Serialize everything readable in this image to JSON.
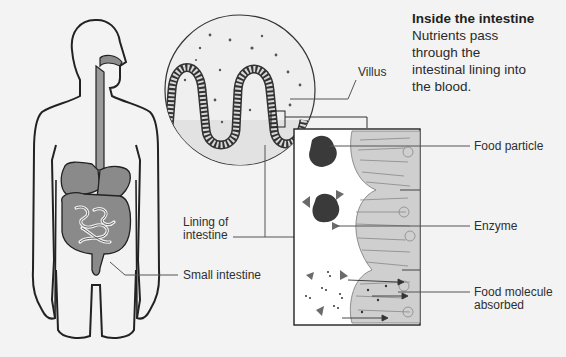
{
  "title": "Inside the intestine",
  "description": "Nutrients pass through the intestinal lining into the blood.",
  "description_lines": [
    "Nutrients pass",
    "through the",
    "intestinal lining into",
    "the blood."
  ],
  "labels": {
    "villus": "Villus",
    "food_particle": "Food particle",
    "enzyme": "Enzyme",
    "lining_of_intestine_line1": "Lining of",
    "lining_of_intestine_line2": "intestine",
    "small_intestine": "Small intestine",
    "food_molecule_line1": "Food molecule",
    "food_molecule_line2": "absorbed"
  },
  "colors": {
    "background": "#f3f3f3",
    "organ_fill": "#8c8c8c",
    "outline": "#222222",
    "food_particle": "#3a3a3a",
    "enzyme": "#6a6a6a",
    "cell_fill": "#c8c8c8",
    "leader_line": "#555555"
  }
}
